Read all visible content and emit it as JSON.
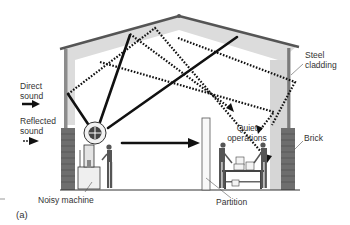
{
  "figure": {
    "panel_label": "(a)"
  },
  "legend": {
    "direct": {
      "label_line1": "Direct",
      "label_line2": "sound",
      "style": "solid"
    },
    "reflected": {
      "label_line1": "Reflected",
      "label_line2": "sound",
      "style": "dotted"
    }
  },
  "labels": {
    "steel_cladding_1": "Steel",
    "steel_cladding_2": "cladding",
    "quiet_1": "Quiet",
    "quiet_2": "operations",
    "brick": "Brick",
    "noisy_machine": "Noisy machine",
    "partition": "Partition"
  },
  "colors": {
    "roof": "#555555",
    "ceiling_shade": "#d9d9d9",
    "wall": "#9a9a9a",
    "ray": "#111111",
    "brick": "#6e6e6e"
  }
}
